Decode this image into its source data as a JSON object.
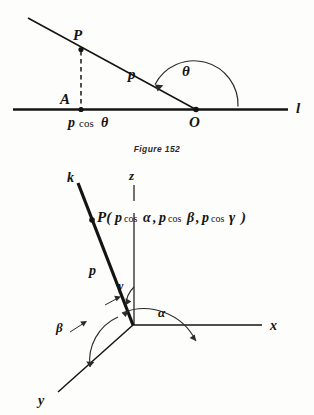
{
  "page": {
    "background_color": "#fdfdfc",
    "ink_color": "#141414"
  },
  "figure_top": {
    "name": "projection-on-line-diagram",
    "caption": "Figure 152",
    "labels": {
      "point_p": "P",
      "point_a": "A",
      "point_o": "O",
      "segment_p": "p",
      "projection": "p cos θ",
      "angle_theta": "θ",
      "line_l": "l"
    }
  },
  "figure_bottom": {
    "name": "direction-cosines-3d-diagram",
    "labels": {
      "axis_x": "x",
      "axis_y": "y",
      "axis_z": "z",
      "ray_k": "k",
      "segment_p": "p",
      "point_label": "P( p cos α, p cos β, p cos γ )",
      "point_label_parts": {
        "prefix": "P(",
        "p1": "p",
        "cos1": "cos",
        "alpha": "α",
        "comma1": ",",
        "p2": "p",
        "cos2": "cos",
        "beta": "β",
        "comma2": ",",
        "p3": "p",
        "cos3": "cos",
        "gamma": "γ",
        "suffix": ")"
      },
      "angle_alpha": "α",
      "angle_beta": "β",
      "angle_gamma": "γ"
    }
  }
}
